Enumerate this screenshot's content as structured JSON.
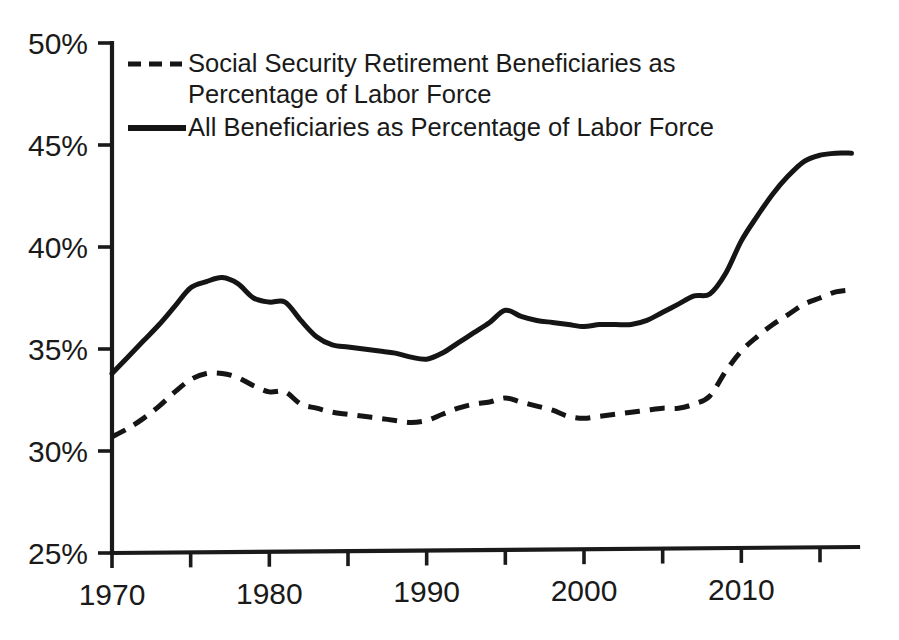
{
  "chart_data": {
    "type": "line",
    "title": "",
    "subtitle": "",
    "xlabel": "",
    "ylabel": "",
    "xlim": [
      1970,
      2017
    ],
    "ylim": [
      25,
      50
    ],
    "ytick_labels": [
      "25%",
      "30%",
      "35%",
      "40%",
      "45%",
      "50%"
    ],
    "ytick_values": [
      25,
      30,
      35,
      40,
      45,
      50
    ],
    "xtick_values": [
      1970,
      1975,
      1980,
      1985,
      1990,
      1995,
      2000,
      2005,
      2010,
      2015
    ],
    "xtick_labels": [
      "1970",
      "",
      "1980",
      "",
      "1990",
      "",
      "2000",
      "",
      "2010",
      ""
    ],
    "xtick_labels_shown": [
      "1970",
      "1980",
      "1990",
      "2000",
      "2010"
    ],
    "grid": false,
    "legend_position": "top-left",
    "x": [
      1970,
      1971,
      1972,
      1973,
      1974,
      1975,
      1976,
      1977,
      1978,
      1979,
      1980,
      1981,
      1982,
      1983,
      1984,
      1985,
      1986,
      1987,
      1988,
      1989,
      1990,
      1991,
      1992,
      1993,
      1994,
      1995,
      1996,
      1997,
      1998,
      1999,
      2000,
      2001,
      2002,
      2003,
      2004,
      2005,
      2006,
      2007,
      2008,
      2009,
      2010,
      2011,
      2012,
      2013,
      2014,
      2015,
      2016,
      2017
    ],
    "series": [
      {
        "name": "Social Security Retirement Beneficiaries as Percentage of Labor Force",
        "style": "dashed",
        "color": "#151515",
        "values": [
          30.7,
          31.1,
          31.6,
          32.2,
          32.9,
          33.5,
          33.8,
          33.8,
          33.6,
          33.2,
          32.9,
          32.9,
          32.3,
          32.1,
          31.9,
          31.8,
          31.7,
          31.6,
          31.5,
          31.4,
          31.5,
          31.8,
          32.1,
          32.3,
          32.4,
          32.6,
          32.4,
          32.2,
          32.0,
          31.7,
          31.6,
          31.7,
          31.8,
          31.9,
          32.0,
          32.1,
          32.1,
          32.3,
          32.7,
          33.9,
          34.9,
          35.6,
          36.2,
          36.7,
          37.2,
          37.5,
          37.8,
          37.9
        ]
      },
      {
        "name": "All Beneficiaries as Percentage of Labor Force",
        "style": "solid",
        "color": "#151515",
        "values": [
          33.8,
          34.6,
          35.4,
          36.2,
          37.1,
          38.0,
          38.3,
          38.5,
          38.2,
          37.5,
          37.3,
          37.3,
          36.4,
          35.6,
          35.2,
          35.1,
          35.0,
          34.9,
          34.8,
          34.6,
          34.5,
          34.8,
          35.3,
          35.8,
          36.3,
          36.9,
          36.6,
          36.4,
          36.3,
          36.2,
          36.1,
          36.2,
          36.2,
          36.2,
          36.4,
          36.8,
          37.2,
          37.6,
          37.7,
          38.7,
          40.3,
          41.5,
          42.6,
          43.5,
          44.2,
          44.5,
          44.6,
          44.6
        ]
      }
    ]
  },
  "axes": {
    "y_ticks": [
      {
        "label": "50%",
        "value": 50
      },
      {
        "label": "45%",
        "value": 45
      },
      {
        "label": "40%",
        "value": 40
      },
      {
        "label": "35%",
        "value": 35
      },
      {
        "label": "30%",
        "value": 30
      },
      {
        "label": "25%",
        "value": 25
      }
    ],
    "x_ticks": [
      {
        "label": "1970",
        "value": 1970,
        "labeled": true
      },
      {
        "label": "",
        "value": 1975,
        "labeled": false
      },
      {
        "label": "1980",
        "value": 1980,
        "labeled": true
      },
      {
        "label": "",
        "value": 1985,
        "labeled": false
      },
      {
        "label": "1990",
        "value": 1990,
        "labeled": true
      },
      {
        "label": "",
        "value": 1995,
        "labeled": false
      },
      {
        "label": "2000",
        "value": 2000,
        "labeled": true
      },
      {
        "label": "",
        "value": 2005,
        "labeled": false
      },
      {
        "label": "2010",
        "value": 2010,
        "labeled": true
      },
      {
        "label": "",
        "value": 2015,
        "labeled": false
      }
    ]
  },
  "legend": {
    "entries": [
      {
        "label": "Social Security Retirement Beneficiaries as Percentage of Labor Force",
        "style": "dashed"
      },
      {
        "label": "All Beneficiaries as Percentage of Labor Force",
        "style": "solid"
      }
    ]
  },
  "colors": {
    "ink": "#151515",
    "axis": "#1a1a1a",
    "background": "#ffffff"
  }
}
